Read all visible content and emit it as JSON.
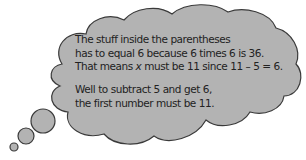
{
  "thought_bubble": {
    "paragraph1": {
      "line1": "The stuff inside the parentheses",
      "line2": "has to equal 6 because 6 times 6 is 36.",
      "line3_before": "That means ",
      "line3_var": "x",
      "line3_after": " must be 11 since 11 – 5 = 6."
    },
    "paragraph2": {
      "line1": "Well to subtract 5 and get 6,",
      "line2": "the first number must be 11."
    },
    "colors": {
      "fill": "#b3b3b3",
      "stroke": "#3a3a3a"
    }
  }
}
